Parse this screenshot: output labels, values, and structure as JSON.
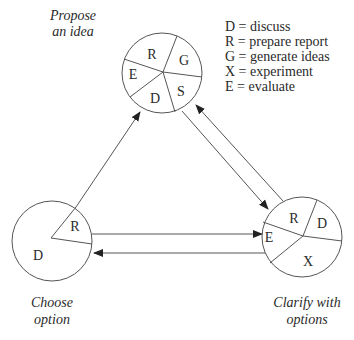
{
  "nodes": {
    "propose": {
      "caption": [
        "Propose",
        "an idea"
      ],
      "slices": [
        "R",
        "G",
        "S",
        "D",
        "E"
      ]
    },
    "choose": {
      "caption": [
        "Choose",
        "option"
      ],
      "slices": [
        "R",
        "D"
      ]
    },
    "clarify": {
      "caption": [
        "Clarify with",
        "options"
      ],
      "slices": [
        "R",
        "D",
        "X",
        "E"
      ]
    }
  },
  "legend": [
    "D = discuss",
    "R = prepare report",
    "G = generate ideas",
    "X = experiment",
    "E = evaluate"
  ],
  "edges": [
    {
      "from": "choose",
      "to": "propose"
    },
    {
      "from": "propose",
      "to": "clarify"
    },
    {
      "from": "clarify",
      "to": "propose"
    },
    {
      "from": "choose",
      "to": "clarify"
    },
    {
      "from": "clarify",
      "to": "choose"
    }
  ],
  "colors": {
    "line": "#555555",
    "text": "#2a2a2a",
    "background": "#ffffff"
  }
}
